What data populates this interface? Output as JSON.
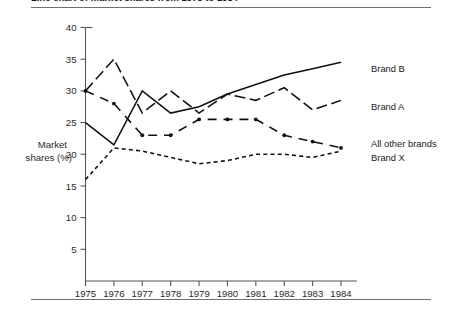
{
  "figure": {
    "title": "Line chart of market shares from 1975 to 1984"
  },
  "chart_data": {
    "type": "line",
    "title": "Line chart of market shares from 1975 to 1984",
    "xlabel": "",
    "ylabel": "Market shares (%)",
    "ylabel_line1": "Market",
    "ylabel_line2": "shares (%)",
    "grid": false,
    "legend_position": "right-inline-labels",
    "xlim": [
      1975,
      1984
    ],
    "ylim": [
      0,
      40
    ],
    "yticks": [
      5,
      10,
      15,
      20,
      25,
      30,
      35,
      40
    ],
    "ytick_labels": [
      "5",
      "10",
      "15",
      "20",
      "25",
      "30",
      "35",
      "40"
    ],
    "x": [
      1975,
      1976,
      1977,
      1978,
      1979,
      1980,
      1981,
      1982,
      1983,
      1984
    ],
    "categories": [
      "1975",
      "1976",
      "1977",
      "1978",
      "1979",
      "1980",
      "1981",
      "1982",
      "1983",
      "1984"
    ],
    "series": [
      {
        "name": "Brand B",
        "style": "solid",
        "markers": false,
        "values": [
          25,
          21.5,
          30,
          26.5,
          27.5,
          29.5,
          31,
          32.5,
          33.5,
          34.5
        ]
      },
      {
        "name": "Brand A",
        "style": "long-dash",
        "markers": false,
        "values": [
          30,
          35,
          26.5,
          30,
          26.5,
          29.5,
          28.5,
          30.5,
          27,
          28.5
        ]
      },
      {
        "name": "All other brands",
        "style": "dash-dot",
        "markers": true,
        "values": [
          30,
          28,
          23,
          23,
          25.5,
          25.5,
          25.5,
          23,
          22,
          21
        ]
      },
      {
        "name": "Brand X",
        "style": "short-dash",
        "markers": false,
        "values": [
          16,
          21,
          20.5,
          19.5,
          18.5,
          19,
          20,
          20,
          19.5,
          20.5
        ]
      }
    ],
    "colors": {
      "ink": "#101010",
      "axis": "#555555",
      "rule": "#6e6e6e"
    }
  }
}
